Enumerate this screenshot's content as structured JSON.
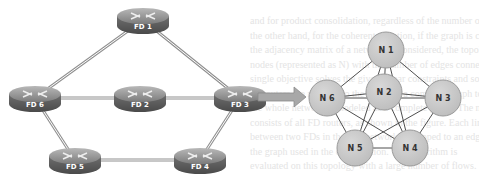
{
  "figure": {
    "left_network": {
      "routers": [
        {
          "id": "FD1",
          "label": "FD 1",
          "x": 143,
          "y": 20
        },
        {
          "id": "FD2",
          "label": "FD 2",
          "x": 140,
          "y": 98
        },
        {
          "id": "FD3",
          "label": "FD 3",
          "x": 240,
          "y": 98
        },
        {
          "id": "FD4",
          "label": "FD 4",
          "x": 200,
          "y": 160
        },
        {
          "id": "FD5",
          "label": "FD 5",
          "x": 75,
          "y": 160
        },
        {
          "id": "FD6",
          "label": "FD 6",
          "x": 35,
          "y": 98
        }
      ],
      "links": [
        [
          "FD1",
          "FD6"
        ],
        [
          "FD1",
          "FD3"
        ],
        [
          "FD6",
          "FD2"
        ],
        [
          "FD2",
          "FD3"
        ],
        [
          "FD6",
          "FD5"
        ],
        [
          "FD5",
          "FD4"
        ],
        [
          "FD4",
          "FD3"
        ]
      ]
    },
    "arrow": {
      "from_x": 258,
      "to_x": 306,
      "y": 97,
      "color": "#a8a8a8"
    },
    "right_graph": {
      "nodes": [
        {
          "id": "N1",
          "label": "N 1",
          "x": 386,
          "y": 50
        },
        {
          "id": "N2",
          "label": "N 2",
          "x": 384,
          "y": 92
        },
        {
          "id": "N3",
          "label": "N 3",
          "x": 443,
          "y": 98
        },
        {
          "id": "N4",
          "label": "N 4",
          "x": 410,
          "y": 148
        },
        {
          "id": "N5",
          "label": "N 5",
          "x": 355,
          "y": 148
        },
        {
          "id": "N6",
          "label": "N 6",
          "x": 327,
          "y": 98
        }
      ],
      "edges": [
        [
          "N1",
          "N2"
        ],
        [
          "N1",
          "N3"
        ],
        [
          "N1",
          "N4"
        ],
        [
          "N1",
          "N5"
        ],
        [
          "N1",
          "N6"
        ],
        [
          "N2",
          "N3"
        ],
        [
          "N2",
          "N4"
        ],
        [
          "N2",
          "N5"
        ],
        [
          "N2",
          "N6"
        ],
        [
          "N3",
          "N4"
        ],
        [
          "N3",
          "N5"
        ],
        [
          "N3",
          "N6"
        ],
        [
          "N4",
          "N5"
        ],
        [
          "N4",
          "N6"
        ],
        [
          "N5",
          "N6"
        ]
      ],
      "node_fill": "#c8c8c8",
      "node_stroke": "#9a9a9a",
      "node_radius": 18
    },
    "colors": {
      "router_top": "#8a8a8a",
      "router_body": "#5a5a5a",
      "link": "#909090",
      "edge": "#3a3a3a"
    }
  },
  "background_bleed_text": [
    "and for product consolidation, regardless of the number of nodes",
    "the other hand, for the coherent equation, if the graph is complete",
    "the adjacency matrix of a network is considered, the topology of the",
    "nodes (represented as N) with the number of edges connected",
    "single objective solves the given linear constraints and solution",
    "all routers are mapped to the nodes of a complete graph topology",
    "the whole network is modeled as a complete graph. The node set",
    "consists of all FD routers, as shown in the figure. Each link",
    "between two FDs in the real network is mapped to an edge in the",
    "the graph used in the optimization. The algorithm is",
    "evaluated on this topology with a large number of flows."
  ]
}
